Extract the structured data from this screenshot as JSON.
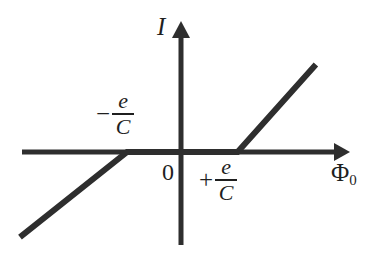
{
  "figure": {
    "background_color": "#ffffff",
    "line_color": "#2e2e2e",
    "text_color": "#1f1f1f"
  },
  "axes": {
    "y_axis_label": "I",
    "x_axis_label_symbol": "Φ",
    "x_axis_label_subscript": "0",
    "origin_label": "0"
  },
  "annotations": {
    "left_threshold": {
      "sign": "−",
      "numerator": "e",
      "denominator": "C"
    },
    "right_threshold": {
      "sign": "+",
      "numerator": "e",
      "denominator": "C"
    }
  },
  "chart_data": {
    "type": "line",
    "title": "",
    "xlabel": "Φ₀",
    "ylabel": "I",
    "grid": false,
    "legend": null,
    "xlim": [
      -1.85,
      1.55
    ],
    "ylim": [
      -1.12,
      1.55
    ],
    "x_threshold_negative": -0.62,
    "x_threshold_positive": 0.65,
    "series": [
      {
        "name": "I(Φ₀)",
        "x": [
          -1.85,
          -0.62,
          0.65,
          1.55
        ],
        "values": [
          -1.12,
          0.0,
          0.0,
          1.15
        ]
      }
    ],
    "annotations": [
      {
        "text": "−e/C",
        "x": -0.62,
        "y": 0.0,
        "placement": "above-left"
      },
      {
        "text": "+e/C",
        "x": 0.65,
        "y": 0.0,
        "placement": "below-right"
      },
      {
        "text": "0",
        "x": 0.0,
        "y": 0.0,
        "placement": "below-left"
      }
    ]
  }
}
